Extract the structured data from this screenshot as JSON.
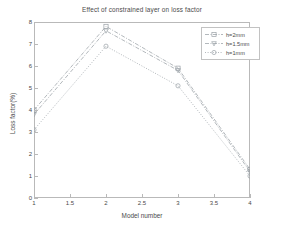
{
  "chart_data": {
    "type": "line",
    "title": "Effect of constrained layer on loss factor",
    "xlabel": "Model number",
    "ylabel": "Loss factor(%)",
    "x": [
      1,
      2,
      3,
      4
    ],
    "xlim": [
      1,
      4
    ],
    "ylim": [
      0,
      8
    ],
    "xticks": [
      "1",
      "1.5",
      "2",
      "2.5",
      "3",
      "3.5",
      "4"
    ],
    "xtick_values": [
      1,
      1.5,
      2,
      2.5,
      3,
      3.5,
      4
    ],
    "yticks": [
      "0",
      "1",
      "2",
      "3",
      "4",
      "5",
      "6",
      "7",
      "8"
    ],
    "ytick_values": [
      0,
      1,
      2,
      3,
      4,
      5,
      6,
      7,
      8
    ],
    "grid": false,
    "legend_position": "upper right",
    "series": [
      {
        "name": "h=2mm",
        "values": [
          4.0,
          7.8,
          5.9,
          1.3
        ],
        "marker": "square",
        "linestyle": "dash-dot",
        "color": "#9aa0a6"
      },
      {
        "name": "h=1.5mm",
        "values": [
          3.8,
          7.6,
          5.8,
          1.2
        ],
        "marker": "triangle-down",
        "linestyle": "dash-dot",
        "color": "#9aa0a6"
      },
      {
        "name": "h=1mm",
        "values": [
          3.1,
          6.9,
          5.1,
          1.0
        ],
        "marker": "circle",
        "linestyle": "dotted",
        "color": "#9aa0a6"
      }
    ]
  },
  "legend": {
    "items": [
      {
        "label": "h=2mm"
      },
      {
        "label": "h=1.5mm"
      },
      {
        "label": "h=1mm"
      }
    ]
  },
  "colors": {
    "axis": "#b9b9b9",
    "text": "#4a4a4a",
    "line": "#9aa0a6",
    "background": "#ffffff"
  }
}
